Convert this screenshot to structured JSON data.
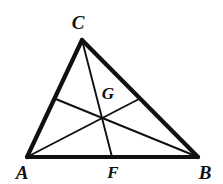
{
  "figure": {
    "type": "geometry-diagram",
    "background_color": "#ffffff",
    "stroke_color": "#101010",
    "side_stroke_width": 4.2,
    "cevian_stroke_width": 1.9,
    "canvas": {
      "width": 223,
      "height": 184
    },
    "points": {
      "A": {
        "x": 27,
        "y": 157
      },
      "B": {
        "x": 198,
        "y": 157
      },
      "C": {
        "x": 82,
        "y": 40
      },
      "F": {
        "x": 112,
        "y": 157
      },
      "D": {
        "x": 54.5,
        "y": 98.5
      },
      "E": {
        "x": 140,
        "y": 98.5
      },
      "G": {
        "x": 103,
        "y": 116
      }
    },
    "sides": [
      {
        "name": "side-AB",
        "from": "A",
        "to": "B"
      },
      {
        "name": "side-AC",
        "from": "A",
        "to": "C"
      },
      {
        "name": "side-CB",
        "from": "C",
        "to": "B"
      }
    ],
    "cevians": [
      {
        "name": "median-CF",
        "from": "C",
        "to": "F"
      },
      {
        "name": "median-AE",
        "from": "A",
        "to": "E"
      },
      {
        "name": "median-BD",
        "from": "B",
        "to": "D"
      }
    ],
    "labels": [
      {
        "id": "C",
        "text": "C",
        "x": 78,
        "y": 22,
        "size": "large"
      },
      {
        "id": "G",
        "text": "G",
        "x": 108,
        "y": 93,
        "size": "small"
      },
      {
        "id": "A",
        "text": "A",
        "x": 22,
        "y": 172,
        "size": "large"
      },
      {
        "id": "F",
        "text": "F",
        "x": 113,
        "y": 172,
        "size": "small"
      },
      {
        "id": "B",
        "text": "B",
        "x": 205,
        "y": 172,
        "size": "large"
      }
    ]
  }
}
